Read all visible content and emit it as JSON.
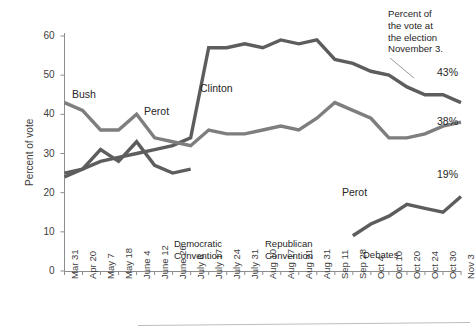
{
  "chart_data": {
    "type": "line",
    "title": "",
    "xlabel": "",
    "ylabel": "Percent of vote",
    "ylim": [
      0,
      60
    ],
    "yticks": [
      0,
      10,
      20,
      30,
      40,
      50,
      60
    ],
    "grid": false,
    "legend_position": "inline-labels",
    "categories": [
      "Mar 31",
      "Apr 20",
      "May 7",
      "May 18",
      "June 4",
      "June 12",
      "June 26",
      "July 6",
      "July 17",
      "July 24",
      "July 31",
      "Aug 10",
      "Aug 17",
      "Aug 21",
      "Aug 31",
      "Sep 11",
      "Sep 28",
      "Oct 4",
      "Oct 10",
      "Oct 20",
      "Oct 24",
      "Oct 30",
      "Nov 3"
    ],
    "series": [
      {
        "name": "Clinton",
        "color": "#5d5d5d",
        "end_value_label": "43%",
        "values": [
          25,
          26,
          28,
          29,
          30,
          31,
          32,
          34,
          57,
          57,
          58,
          57,
          59,
          58,
          59,
          54,
          53,
          51,
          50,
          47,
          45,
          45,
          43
        ]
      },
      {
        "name": "Bush",
        "color": "#7e7e7e",
        "end_value_label": "38%",
        "values": [
          43,
          41,
          36,
          36,
          40,
          34,
          33,
          32,
          36,
          35,
          35,
          36,
          37,
          36,
          39,
          43,
          41,
          39,
          34,
          34,
          35,
          37,
          38
        ]
      },
      {
        "name": "Perot",
        "color": "#5d5d5d",
        "end_value_label": "19%",
        "values": [
          24,
          26,
          31,
          28,
          33,
          27,
          25,
          26,
          null,
          null,
          null,
          null,
          null,
          null,
          null,
          null,
          9,
          12,
          14,
          17,
          16,
          15,
          19
        ]
      }
    ],
    "annotations": [
      {
        "text_line1": "Democratic",
        "text_line2": "Convention",
        "at_category": "July 6"
      },
      {
        "text_line1": "Republican",
        "text_line2": "Convention",
        "at_category": "Aug 17"
      },
      {
        "text_line1": "Debates",
        "text_line2": "",
        "at_category": "Oct 10"
      }
    ],
    "callout": {
      "line1": "Percent of the",
      "line2": "vote at",
      "line3": "the election",
      "line4": "November 3.",
      "full": "Percent of the vote at the election November 3."
    }
  },
  "series_labels": {
    "bush": "Bush",
    "perot_early": "Perot",
    "clinton": "Clinton",
    "perot_late": "Perot"
  },
  "end_labels": {
    "clinton": "43%",
    "bush": "38%",
    "perot": "19%"
  },
  "callout_lines": {
    "l1": "Percent of",
    "l2": "the vote at",
    "l3": "the election",
    "l4": "November 3."
  },
  "annotation_text": {
    "dem_l1": "Democratic",
    "dem_l2": "Convention",
    "rep_l1": "Republican",
    "rep_l2": "Convention",
    "debates": "Debates"
  },
  "axis": {
    "y_title": "Percent of vote",
    "y_ticks": [
      "60",
      "50",
      "40",
      "30",
      "20",
      "10",
      "0"
    ],
    "x_ticks": [
      "Mar 31",
      "Apr 20",
      "May 7",
      "May 18",
      "June 4",
      "June 12",
      "June 26",
      "July 6",
      "July 17",
      "July 24",
      "July 31",
      "Aug 10",
      "Aug 17",
      "Aug 21",
      "Aug 31",
      "Sep 11",
      "Sep 28",
      "Oct 4",
      "Oct 10",
      "Oct 20",
      "Oct 24",
      "Oct 30",
      "Nov 3"
    ]
  },
  "edge": {
    "mark": ""
  }
}
